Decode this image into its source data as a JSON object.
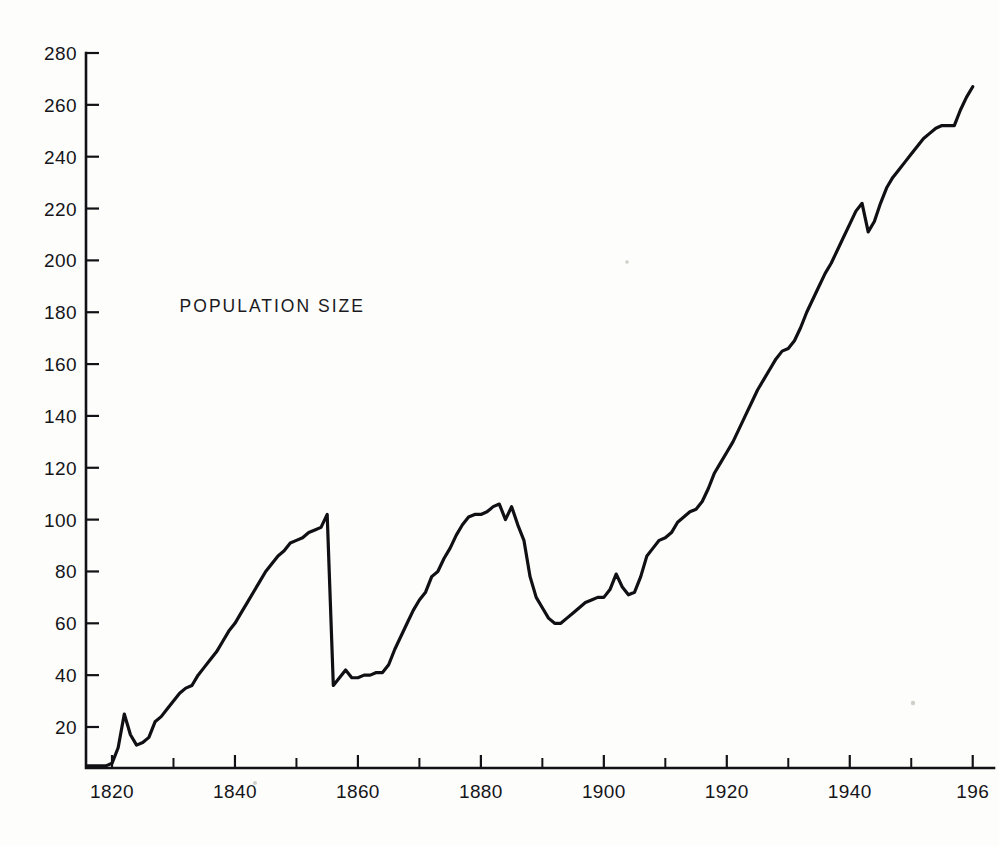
{
  "page": {
    "background_color": "#fdfdfb",
    "ink_color": "#101014"
  },
  "annotation": {
    "text": "POPULATION  SIZE"
  },
  "chart_data": {
    "type": "line",
    "title": "POPULATION  SIZE",
    "xlabel": "",
    "ylabel": "",
    "grid": false,
    "legend": null,
    "line_color": "#101014",
    "xlim": [
      1816,
      1960
    ],
    "ylim": [
      0,
      280
    ],
    "x_tick_labels": [
      "1820",
      "1840",
      "1860",
      "1880",
      "1900",
      "1920",
      "1940",
      "196"
    ],
    "x_tick_label_values": [
      1820,
      1840,
      1860,
      1880,
      1900,
      1920,
      1940,
      1960
    ],
    "x_ticks_all": [
      1820,
      1830,
      1840,
      1850,
      1860,
      1870,
      1880,
      1890,
      1900,
      1910,
      1920,
      1930,
      1940,
      1950,
      1960
    ],
    "x_tick_interval": 10,
    "x_label_interval": 20,
    "y_tick_labels": [
      "20",
      "40",
      "60",
      "80",
      "100",
      "120",
      "140",
      "160",
      "180",
      "200",
      "220",
      "240",
      "260",
      "280"
    ],
    "y_ticks": [
      20,
      40,
      60,
      80,
      100,
      120,
      140,
      160,
      180,
      200,
      220,
      240,
      260,
      280
    ],
    "y_tick_interval": 20,
    "series": [
      {
        "name": "Population size",
        "x": [
          1816,
          1817,
          1818,
          1819,
          1820,
          1821,
          1822,
          1823,
          1824,
          1825,
          1826,
          1827,
          1828,
          1829,
          1830,
          1831,
          1832,
          1833,
          1834,
          1835,
          1836,
          1837,
          1838,
          1839,
          1840,
          1841,
          1842,
          1843,
          1844,
          1845,
          1846,
          1847,
          1848,
          1849,
          1850,
          1851,
          1852,
          1853,
          1854,
          1855,
          1856,
          1857,
          1858,
          1859,
          1860,
          1861,
          1862,
          1863,
          1864,
          1865,
          1866,
          1867,
          1868,
          1869,
          1870,
          1871,
          1872,
          1873,
          1874,
          1875,
          1876,
          1877,
          1878,
          1879,
          1880,
          1881,
          1882,
          1883,
          1884,
          1885,
          1886,
          1887,
          1888,
          1889,
          1890,
          1891,
          1892,
          1893,
          1894,
          1895,
          1896,
          1897,
          1898,
          1899,
          1900,
          1901,
          1902,
          1903,
          1904,
          1905,
          1906,
          1907,
          1908,
          1909,
          1910,
          1911,
          1912,
          1913,
          1914,
          1915,
          1916,
          1917,
          1918,
          1919,
          1920,
          1921,
          1922,
          1923,
          1924,
          1925,
          1926,
          1927,
          1928,
          1929,
          1930,
          1931,
          1932,
          1933,
          1934,
          1935,
          1936,
          1937,
          1938,
          1939,
          1940,
          1941,
          1942,
          1943,
          1944,
          1945,
          1946,
          1947,
          1948,
          1949,
          1950,
          1951,
          1952,
          1953,
          1954,
          1955,
          1956,
          1957,
          1958,
          1959,
          1960
        ],
        "y": [
          5,
          5,
          5,
          5,
          6,
          12,
          25,
          17,
          13,
          14,
          16,
          22,
          24,
          27,
          30,
          33,
          35,
          36,
          40,
          43,
          46,
          49,
          53,
          57,
          60,
          64,
          68,
          72,
          76,
          80,
          83,
          86,
          88,
          91,
          92,
          93,
          95,
          96,
          97,
          102,
          36,
          39,
          42,
          39,
          39,
          40,
          40,
          41,
          41,
          44,
          50,
          55,
          60,
          65,
          69,
          72,
          78,
          80,
          85,
          89,
          94,
          98,
          101,
          102,
          102,
          103,
          105,
          106,
          100,
          105,
          98,
          92,
          78,
          70,
          66,
          62,
          60,
          60,
          62,
          64,
          66,
          68,
          69,
          70,
          70,
          73,
          79,
          74,
          71,
          72,
          78,
          86,
          89,
          92,
          93,
          95,
          99,
          101,
          103,
          104,
          107,
          112,
          118,
          122,
          126,
          130,
          135,
          140,
          145,
          150,
          154,
          158,
          162,
          165,
          166,
          169,
          174,
          180,
          185,
          190,
          195,
          199,
          204,
          209,
          214,
          219,
          222,
          211,
          215,
          222,
          228,
          232,
          235,
          238,
          241,
          244,
          247,
          249,
          251,
          252,
          252,
          252,
          258,
          263,
          267
        ]
      }
    ],
    "annotations": [
      {
        "text": "POPULATION  SIZE",
        "x": 1831,
        "y": 180
      }
    ],
    "notable_features": [
      {
        "label": "early peak",
        "x": 1822,
        "y": 25
      },
      {
        "label": "first crash onset",
        "x": 1855,
        "y": 102
      },
      {
        "label": "first crash trough",
        "x": 1856,
        "y": 36
      },
      {
        "label": "second peak",
        "x": 1883,
        "y": 106
      },
      {
        "label": "second crash trough",
        "x": 1892,
        "y": 60
      },
      {
        "label": "final value",
        "x": 1960,
        "y": 267
      }
    ]
  }
}
